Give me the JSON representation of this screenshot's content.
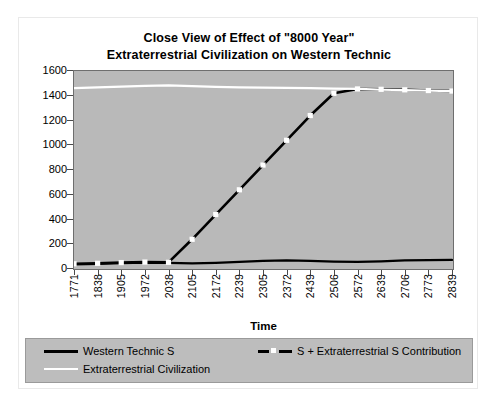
{
  "chart_data": {
    "type": "line",
    "title": "Close View of Effect of \"8000 Year\" Extraterrestrial Civilization on Western Technic",
    "title_lines": [
      "Close View of Effect of \"8000 Year\"",
      "Extraterrestrial Civilization on Western Technic"
    ],
    "xlabel": "Time",
    "ylabel": "",
    "ylim": [
      0,
      1600
    ],
    "y_ticks": [
      0,
      200,
      400,
      600,
      800,
      1000,
      1200,
      1400,
      1600
    ],
    "categories": [
      1771,
      1838,
      1905,
      1972,
      2038,
      2105,
      2172,
      2239,
      2305,
      2372,
      2439,
      2506,
      2572,
      2639,
      2706,
      2773,
      2839
    ],
    "grid": false,
    "legend_position": "bottom",
    "plot_background": "#b9b9b9",
    "series": [
      {
        "name": "Western Technic S",
        "style": "solid",
        "color": "#000000",
        "marker": "none",
        "values": [
          38,
          42,
          48,
          52,
          50,
          46,
          50,
          58,
          66,
          70,
          66,
          60,
          58,
          62,
          70,
          72,
          74
        ]
      },
      {
        "name": "S + Extraterrestrial S Contribution",
        "style": "dashed",
        "color": "#000000",
        "marker": "square-white",
        "values": [
          42,
          46,
          52,
          56,
          54,
          240,
          440,
          640,
          840,
          1040,
          1240,
          1420,
          1455,
          1452,
          1448,
          1442,
          1438
        ]
      },
      {
        "name": "Extraterrestrial Civilization",
        "style": "solid",
        "color": "#ffffff",
        "marker": "none",
        "values": [
          1462,
          1468,
          1474,
          1480,
          1484,
          1478,
          1472,
          1468,
          1466,
          1464,
          1462,
          1458,
          1455,
          1450,
          1446,
          1442,
          1438
        ]
      }
    ]
  },
  "legend": {
    "items": [
      {
        "label": "Western Technic S",
        "swatch": "solid-black"
      },
      {
        "label": "S + Extraterrestrial S Contribution",
        "swatch": "dashed-marker"
      },
      {
        "label": "Extraterrestrial Civilization",
        "swatch": "solid-white"
      }
    ]
  }
}
